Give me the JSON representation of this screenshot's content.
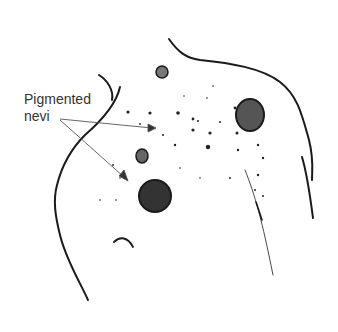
{
  "figure": {
    "label_line1": "Pigmented",
    "label_line2": "nevi",
    "ink_color": "#1a1a1a",
    "arrow_color": "#555555"
  }
}
